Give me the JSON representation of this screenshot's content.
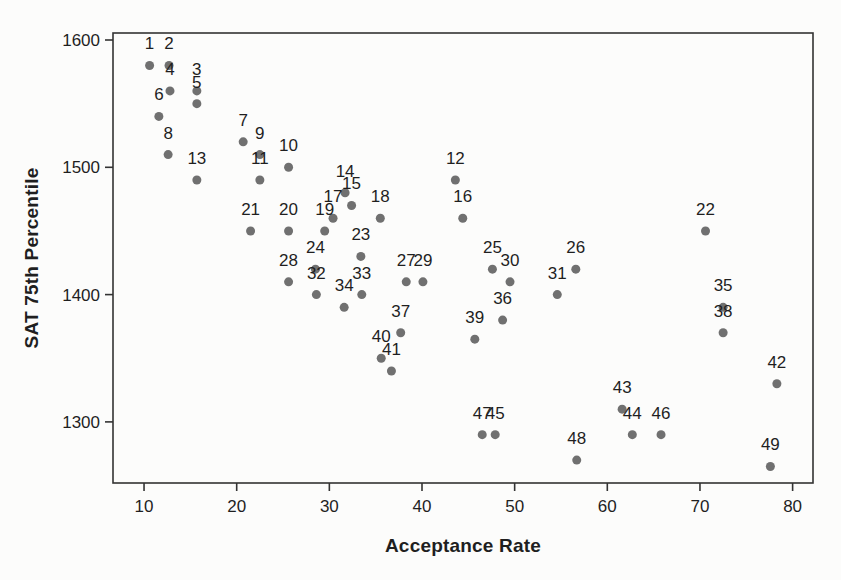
{
  "figure": {
    "kind": "printed-scatterplot-scan",
    "background": "#fcfcfb",
    "frame_color": "#333333",
    "text_color": "#1f1f1f"
  },
  "chart_data": {
    "type": "scatter",
    "title": "",
    "xlabel": "Acceptance Rate",
    "ylabel": "SAT 75th Percentile",
    "xlim": [
      6.65,
      82.2
    ],
    "ylim": [
      1252,
      1605.5
    ],
    "x_ticks": [
      10,
      20,
      30,
      40,
      50,
      60,
      70,
      80
    ],
    "y_ticks": [
      1300,
      1400,
      1500,
      1600
    ],
    "grid": false,
    "legend": null,
    "marker": {
      "shape": "circle",
      "color": "#707070",
      "radius": 4.5
    },
    "point_label_style": {
      "position": "above",
      "color": "#1f1f1f"
    },
    "points": [
      {
        "id": "1",
        "x": 10.6,
        "y": 1580
      },
      {
        "id": "2",
        "x": 12.7,
        "y": 1580
      },
      {
        "id": "3",
        "x": 15.7,
        "y": 1560
      },
      {
        "id": "4",
        "x": 12.8,
        "y": 1560
      },
      {
        "id": "5",
        "x": 15.7,
        "y": 1550
      },
      {
        "id": "6",
        "x": 11.6,
        "y": 1540
      },
      {
        "id": "7",
        "x": 20.7,
        "y": 1520
      },
      {
        "id": "8",
        "x": 12.6,
        "y": 1510
      },
      {
        "id": "9",
        "x": 22.5,
        "y": 1510
      },
      {
        "id": "10",
        "x": 25.6,
        "y": 1500
      },
      {
        "id": "11",
        "x": 22.5,
        "y": 1490
      },
      {
        "id": "12",
        "x": 43.6,
        "y": 1490
      },
      {
        "id": "13",
        "x": 15.7,
        "y": 1490
      },
      {
        "id": "14",
        "x": 31.7,
        "y": 1480
      },
      {
        "id": "15",
        "x": 32.4,
        "y": 1470
      },
      {
        "id": "16",
        "x": 44.4,
        "y": 1460
      },
      {
        "id": "17",
        "x": 30.4,
        "y": 1460
      },
      {
        "id": "18",
        "x": 35.5,
        "y": 1460
      },
      {
        "id": "19",
        "x": 29.5,
        "y": 1450
      },
      {
        "id": "20",
        "x": 25.6,
        "y": 1450
      },
      {
        "id": "21",
        "x": 21.5,
        "y": 1450
      },
      {
        "id": "22",
        "x": 70.6,
        "y": 1450
      },
      {
        "id": "23",
        "x": 33.4,
        "y": 1430
      },
      {
        "id": "24",
        "x": 28.5,
        "y": 1420
      },
      {
        "id": "25",
        "x": 47.6,
        "y": 1420
      },
      {
        "id": "26",
        "x": 56.6,
        "y": 1420
      },
      {
        "id": "27",
        "x": 38.3,
        "y": 1410
      },
      {
        "id": "28",
        "x": 25.6,
        "y": 1410
      },
      {
        "id": "29",
        "x": 40.1,
        "y": 1410
      },
      {
        "id": "30",
        "x": 49.5,
        "y": 1410
      },
      {
        "id": "31",
        "x": 54.6,
        "y": 1400
      },
      {
        "id": "32",
        "x": 28.6,
        "y": 1400
      },
      {
        "id": "33",
        "x": 33.5,
        "y": 1400
      },
      {
        "id": "34",
        "x": 31.6,
        "y": 1390
      },
      {
        "id": "35",
        "x": 72.5,
        "y": 1390
      },
      {
        "id": "36",
        "x": 48.7,
        "y": 1380
      },
      {
        "id": "37",
        "x": 37.7,
        "y": 1370
      },
      {
        "id": "38",
        "x": 72.5,
        "y": 1370
      },
      {
        "id": "39",
        "x": 45.7,
        "y": 1365
      },
      {
        "id": "40",
        "x": 35.6,
        "y": 1350
      },
      {
        "id": "41",
        "x": 36.7,
        "y": 1340
      },
      {
        "id": "42",
        "x": 78.3,
        "y": 1330
      },
      {
        "id": "43",
        "x": 61.6,
        "y": 1310
      },
      {
        "id": "44",
        "x": 62.7,
        "y": 1290
      },
      {
        "id": "45",
        "x": 47.9,
        "y": 1290
      },
      {
        "id": "46",
        "x": 65.8,
        "y": 1290
      },
      {
        "id": "47",
        "x": 46.5,
        "y": 1290
      },
      {
        "id": "48",
        "x": 56.7,
        "y": 1270
      },
      {
        "id": "49",
        "x": 77.6,
        "y": 1265
      }
    ]
  }
}
